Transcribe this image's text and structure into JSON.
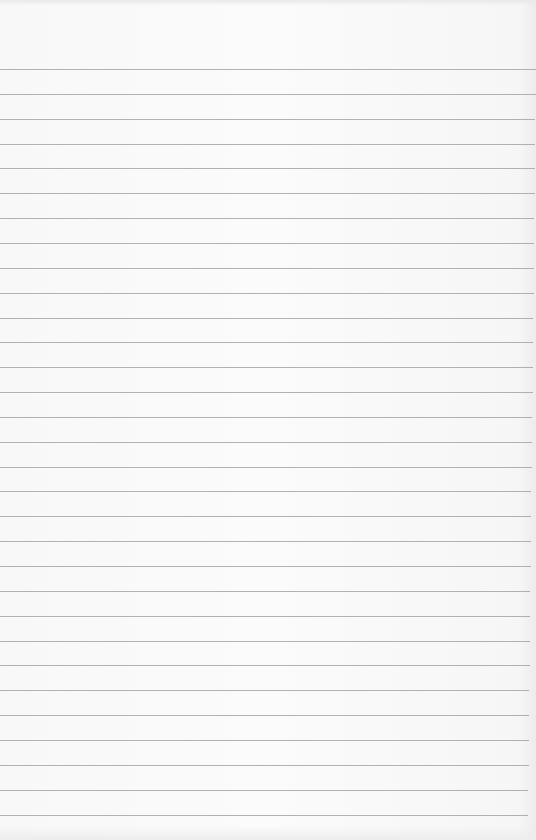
{
  "paper": {
    "type": "lined notebook paper",
    "background_color": "#fafafa",
    "rule_color": "#9a9a9a",
    "rule_count": 31,
    "first_rule_y": 69,
    "rule_spacing": 24.85,
    "rule_right_inset_top": 0,
    "rule_right_inset_bottom": 8
  }
}
